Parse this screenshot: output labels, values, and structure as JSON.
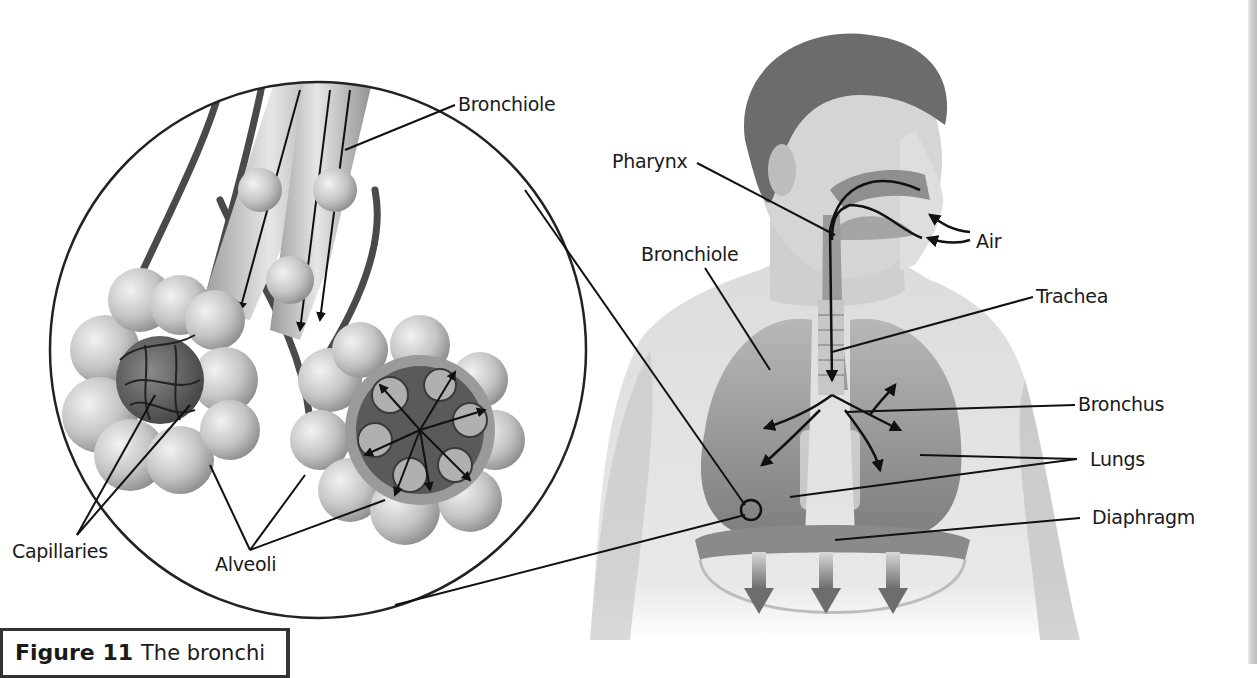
{
  "diagram": {
    "labels": {
      "bronchiole_inset": "Bronchiole",
      "pharynx": "Pharynx",
      "bronchiole_body": "Bronchiole",
      "air": "Air",
      "trachea": "Trachea",
      "bronchus": "Bronchus",
      "lungs": "Lungs",
      "diaphragm": "Diaphragm",
      "capillaries": "Capillaries",
      "alveoli": "Alveoli"
    },
    "caption": {
      "figure": "Figure 11",
      "text": "The bronchi"
    },
    "colors": {
      "ink": "#1a1a1a",
      "skin_light": "#d9d9d9",
      "skin_mid": "#b5b5b5",
      "organ_dark": "#7a7a7a",
      "background": "#ffffff"
    }
  }
}
